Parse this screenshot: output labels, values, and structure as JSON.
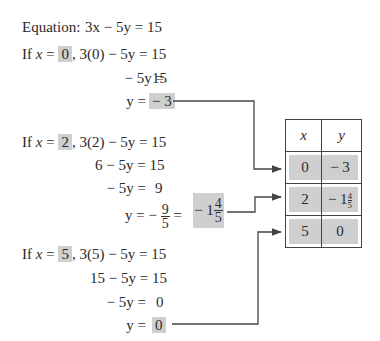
{
  "equation": {
    "label": "Equation:",
    "expr": "3x − 5y = 15"
  },
  "cases": [
    {
      "x_value": "0",
      "substitution": ", 3(0) − 5y = ",
      "substitution_rhs": "15",
      "steps": [
        {
          "lhs": "− 5y =",
          "rhs": "15"
        }
      ],
      "result_lhs": "y =",
      "result": "− 3"
    },
    {
      "x_value": "2",
      "substitution": ", 3(2) − 5y = 15",
      "steps": [
        {
          "lhs": "6 − 5y = 15",
          "rhs": ""
        },
        {
          "lhs": "− 5y =",
          "rhs": "9"
        }
      ],
      "result_lhs": "y =",
      "result_frac_sign": "−",
      "result_frac_num": "9",
      "result_frac_den": "5",
      "result_mixed_whole": "− 1",
      "result_mixed_num": "4",
      "result_mixed_den": "5"
    },
    {
      "x_value": "5",
      "substitution": ", 3(5) − 5y = 15",
      "steps": [
        {
          "lhs": "15 − 5y = 15",
          "rhs": ""
        },
        {
          "lhs": "− 5y =",
          "rhs": "0"
        }
      ],
      "result_lhs": "y =",
      "result": "0"
    }
  ],
  "if_label": "If",
  "x_var": "x",
  "equals": "=",
  "table": {
    "headers": [
      "x",
      "y"
    ],
    "rows": [
      {
        "x": "0",
        "y": "− 3"
      },
      {
        "x": "2",
        "y_whole": "− 1",
        "y_num": "4",
        "y_den": "5"
      },
      {
        "x": "5",
        "y": "0"
      }
    ]
  },
  "colors": {
    "highlight": "#cfcfcf",
    "line": "#444444",
    "text": "#2a2a2a"
  }
}
